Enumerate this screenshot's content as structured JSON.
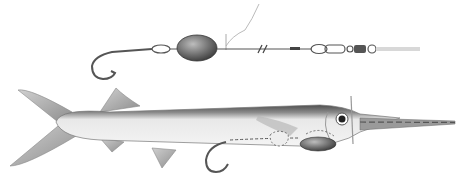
{
  "illustration": {
    "subject": "ballyhoo rigged with hook and egg sinker",
    "rig": {
      "components": [
        "hook",
        "leader loop",
        "egg sinker",
        "wire leader",
        "break mark",
        "crimp",
        "swivel",
        "snap swivel",
        "main line"
      ]
    },
    "fish": {
      "name": "ballyhoo",
      "parts": [
        "tail",
        "dorsal fin",
        "anal fin",
        "body",
        "hook",
        "egg sinker",
        "eye",
        "bill",
        "wire wrap"
      ]
    },
    "colors": {
      "background": "#ffffff",
      "line": "#555555",
      "sinker": "#6b6b6b",
      "fish_back": "#5a5a5a",
      "fish_belly": "#f2f2f2",
      "main_line": "#d8d8d8"
    }
  }
}
